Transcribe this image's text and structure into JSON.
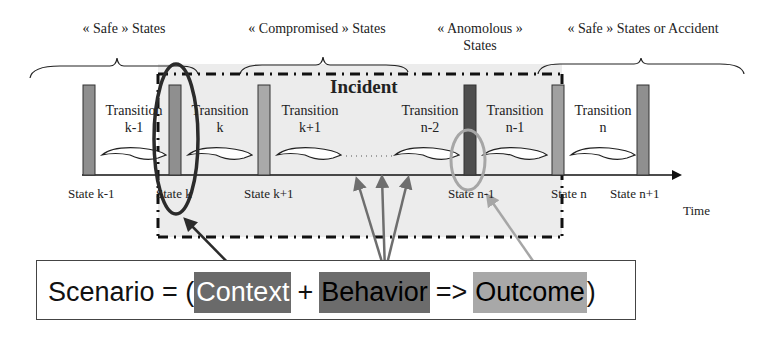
{
  "diagram": {
    "group_labels": [
      {
        "id": "safe",
        "text": "« Safe » States"
      },
      {
        "id": "compromised",
        "text": "« Compromised » States"
      },
      {
        "id": "anomalous_line1",
        "text": "« Anomolous »"
      },
      {
        "id": "anomalous_line2",
        "text": "States"
      },
      {
        "id": "safe_or_accident",
        "text": "« Safe » States or Accident"
      }
    ],
    "incident_label": "Incident",
    "transitions": [
      {
        "line1": "Transition",
        "line2": "k-1"
      },
      {
        "line1": "Transition",
        "line2": "k"
      },
      {
        "line1": "Transition",
        "line2": "k+1"
      },
      {
        "line1": "Transition",
        "line2": "n-2"
      },
      {
        "line1": "Transition",
        "line2": "n-1"
      },
      {
        "line1": "Transition",
        "line2": "n"
      }
    ],
    "states": [
      {
        "label": "State k-1",
        "color": "#8f8f8f"
      },
      {
        "label": "State k",
        "color": "#8f8f8f"
      },
      {
        "label": "State k+1",
        "color": "#a9a9a9"
      },
      {
        "label": "State n-1",
        "color": "#4e4e4e"
      },
      {
        "label": "State n",
        "color": "#a0a0a0"
      },
      {
        "label": "State n+1",
        "color": "#8f8f8f"
      }
    ],
    "axis_label": "Time",
    "ellipsis": "........",
    "colors": {
      "incident_fill": "#ececec",
      "context_ellipse": "#2b2b2b",
      "outcome_ellipse": "#a6a6a6",
      "behavior_arrows": "#6e6e6e",
      "outcome_arrow": "#a6a6a6",
      "context_arrow": "#2b2b2b"
    }
  },
  "formula": {
    "prefix": "Scenario = (",
    "context": "Context",
    "plus": "+",
    "behavior": "Behavior",
    "implies": "=>",
    "outcome": "Outcome",
    "suffix": ")"
  }
}
